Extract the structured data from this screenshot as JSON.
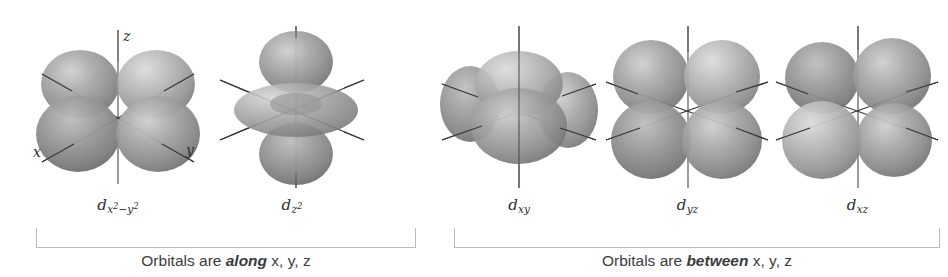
{
  "figure": {
    "background_color": "#ffffff",
    "lobe_color": "#8c8c8c",
    "lobe_highlight_color": "#d8d8d8",
    "lobe_shadow_color": "#5f5f5f",
    "axis_color": "#3a3a3a",
    "bracket_color": "#b9b9b9",
    "text_color": "#3c3c3c"
  },
  "axes": {
    "x_label": "x",
    "y_label": "y",
    "z_label": "z"
  },
  "groups": [
    {
      "id": "along",
      "caption_prefix": "Orbitals are ",
      "caption_emphasis": "along",
      "caption_suffix": " x, y, z",
      "orbitals": [
        {
          "id": "dx2-y2",
          "label_base": "d",
          "label_sub_plain": "x2−y2",
          "sub_parts": [
            {
              "text": "x",
              "sup": "2"
            },
            {
              "text": "−",
              "sup": ""
            },
            {
              "text": "y",
              "sup": "2"
            }
          ],
          "shape": "cloverleaf-along-axes",
          "lobe_count": 4,
          "shows_axis_labels": true
        },
        {
          "id": "dz2",
          "label_base": "d",
          "label_sub_plain": "z2",
          "sub_parts": [
            {
              "text": "z",
              "sup": "2"
            }
          ],
          "shape": "dumbbell-with-torus",
          "lobe_count": 2,
          "shows_axis_labels": false
        }
      ]
    },
    {
      "id": "between",
      "caption_prefix": "Orbitals are ",
      "caption_emphasis": "between",
      "caption_suffix": " x, y, z",
      "orbitals": [
        {
          "id": "dxy",
          "label_base": "d",
          "label_sub_plain": "xy",
          "sub_parts": [
            {
              "text": "xy",
              "sup": ""
            }
          ],
          "shape": "cloverleaf-edge-on",
          "lobe_count": 4,
          "shows_axis_labels": false
        },
        {
          "id": "dyz",
          "label_base": "d",
          "label_sub_plain": "yz",
          "sub_parts": [
            {
              "text": "yz",
              "sup": ""
            }
          ],
          "shape": "cloverleaf-between-axes",
          "lobe_count": 4,
          "shows_axis_labels": false
        },
        {
          "id": "dxz",
          "label_base": "d",
          "label_sub_plain": "xz",
          "sub_parts": [
            {
              "text": "xz",
              "sup": ""
            }
          ],
          "shape": "cloverleaf-between-axes",
          "lobe_count": 4,
          "shows_axis_labels": false
        }
      ]
    }
  ]
}
